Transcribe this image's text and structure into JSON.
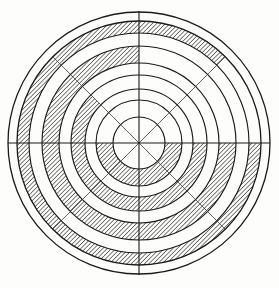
{
  "figure": {
    "kind": "polar-ring-chart",
    "background_color": "#fdfdfb",
    "line_color": "#1a1a1a",
    "spoke_color": "#3a3a3a",
    "hatch_color": "#333333",
    "hatch_angle_deg": 45,
    "center": {
      "x": 139,
      "y": 143
    },
    "axes": {
      "horizontal_y": 143,
      "horizontal_x1": 8,
      "horizontal_x2": 270,
      "vertical_x": 139,
      "vertical_y1": 11,
      "vertical_y2": 275
    }
  },
  "chart_data": {
    "type": "pie",
    "subtitle": "",
    "xlabel": "",
    "ylabel": "",
    "grid": true,
    "legend": "none",
    "center": {
      "x": 139,
      "y": 143
    },
    "radii": [
      26,
      43,
      54,
      68,
      80,
      97,
      110,
      122,
      131
    ],
    "ring_count": 8,
    "spoke_count": 8,
    "spoke_angles_deg": [
      0,
      45,
      90,
      135,
      180,
      225,
      270,
      315
    ],
    "sector_angle_deg": 45,
    "categories": [
      "0-45",
      "45-90",
      "90-135",
      "135-180",
      "180-225",
      "225-270",
      "270-315",
      "315-360"
    ],
    "rings": [
      {
        "index": 0,
        "r_inner": 0,
        "r_outer": 26,
        "filled_sectors": []
      },
      {
        "index": 1,
        "r_inner": 26,
        "r_outer": 43,
        "filled_sectors": [
          180,
          225,
          270,
          315
        ]
      },
      {
        "index": 2,
        "r_inner": 43,
        "r_outer": 54,
        "filled_sectors": []
      },
      {
        "index": 3,
        "r_inner": 54,
        "r_outer": 68,
        "filled_sectors": [
          135,
          180,
          225,
          270,
          315
        ]
      },
      {
        "index": 4,
        "r_inner": 68,
        "r_outer": 80,
        "filled_sectors": []
      },
      {
        "index": 5,
        "r_inner": 80,
        "r_outer": 97,
        "filled_sectors": [
          90,
          135,
          180,
          225,
          270,
          315
        ]
      },
      {
        "index": 6,
        "r_inner": 97,
        "r_outer": 110,
        "filled_sectors": []
      },
      {
        "index": 7,
        "r_inner": 110,
        "r_outer": 122,
        "filled_sectors": [
          45,
          90,
          135,
          180,
          225,
          270,
          315
        ]
      },
      {
        "index": 8,
        "r_inner": 122,
        "r_outer": 131,
        "filled_sectors": []
      }
    ],
    "values": [
      0,
      1,
      0,
      1,
      0,
      1,
      0,
      1
    ]
  }
}
